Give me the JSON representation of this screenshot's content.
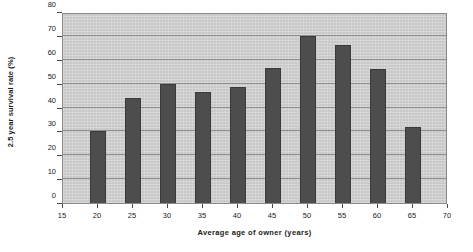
{
  "chart_data": {
    "type": "bar",
    "title": "",
    "xlabel": "Average age of owner (years)",
    "ylabel": "2.5 year survival rate (%)",
    "categories": [
      20,
      25,
      30,
      35,
      40,
      45,
      50,
      55,
      60,
      65
    ],
    "values": [
      30,
      44,
      50,
      46.5,
      48.5,
      56.5,
      70,
      66,
      56,
      32
    ],
    "xlim": [
      15,
      70
    ],
    "ylim": [
      0,
      80
    ],
    "xticks": [
      15,
      20,
      25,
      30,
      35,
      40,
      45,
      50,
      55,
      60,
      65,
      70
    ],
    "yticks": [
      0,
      10,
      20,
      30,
      40,
      50,
      60,
      70,
      80
    ],
    "xtick_labels": [
      "15",
      "20",
      "25",
      "30",
      "35",
      "40",
      "45",
      "50",
      "55",
      "60",
      "65",
      "70"
    ],
    "ytick_labels": [
      "0",
      "10",
      "20",
      "30",
      "40",
      "50",
      "60",
      "70",
      "80"
    ],
    "grid": "horizontal",
    "legend": null,
    "series": [
      {
        "name": "2.5 year survival rate",
        "values": [
          30,
          44,
          50,
          46.5,
          48.5,
          56.5,
          70,
          66,
          56,
          32
        ]
      }
    ],
    "colors": {
      "bar": "#4d4d4d",
      "plot_background": "#c8c8c8",
      "gridline": "#8f8f8f",
      "axis": "#4a4a4a",
      "text": "#1a1a1a",
      "page_background": "#ffffff"
    }
  }
}
